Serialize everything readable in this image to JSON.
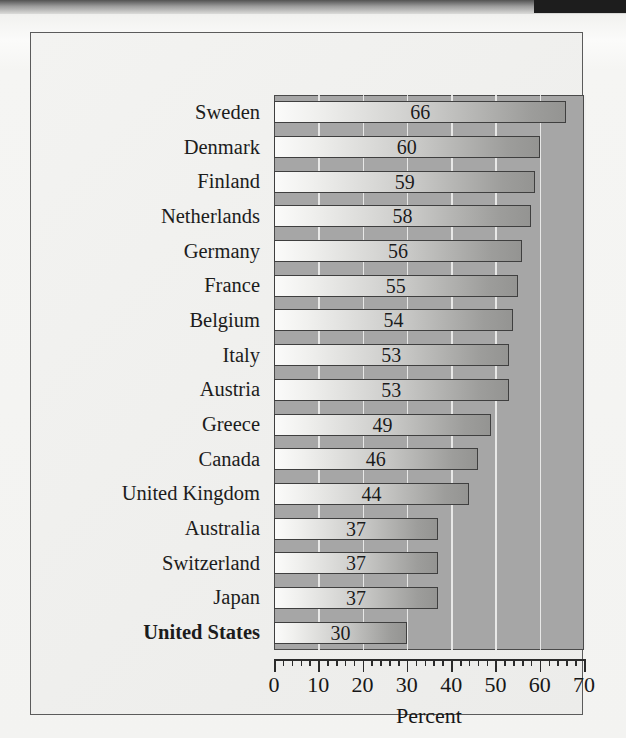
{
  "chart_data": {
    "type": "bar",
    "orientation": "horizontal",
    "title": "",
    "subtitle": "",
    "xlabel": "Percent",
    "ylabel": "",
    "xlim": [
      0,
      70
    ],
    "xticks": [
      0,
      10,
      20,
      30,
      40,
      50,
      60,
      70
    ],
    "xtick_labels": [
      "0",
      "10",
      "20",
      "30",
      "40",
      "50",
      "60",
      "70"
    ],
    "minor_tick_step": 2,
    "grid": "vertical-white-gridlines-every-10",
    "legend": "none",
    "categories": [
      "Sweden",
      "Denmark",
      "Finland",
      "Netherlands",
      "Germany",
      "France",
      "Belgium",
      "Italy",
      "Austria",
      "Greece",
      "Canada",
      "United Kingdom",
      "Australia",
      "Switzerland",
      "Japan",
      "United States"
    ],
    "values": [
      66,
      60,
      59,
      58,
      56,
      55,
      54,
      53,
      53,
      49,
      46,
      44,
      37,
      37,
      37,
      30
    ],
    "value_labels": [
      "66",
      "60",
      "59",
      "58",
      "56",
      "55",
      "54",
      "53",
      "53",
      "49",
      "46",
      "44",
      "37",
      "37",
      "37",
      "30"
    ],
    "emphasized_category": "United States",
    "colors": {
      "plot_background": "#a6a6a6",
      "gridline": "#f0f0ee",
      "bar_fill_light": "#fbfbfa",
      "bar_fill_dark": "#949492",
      "bar_border": "#3f3f3f",
      "axis": "#2b2b2b",
      "text": "#1c1c1c",
      "page_background": "#f3f3f1",
      "frame_border": "#5b5b5b"
    }
  }
}
